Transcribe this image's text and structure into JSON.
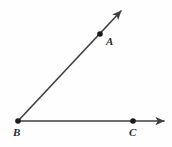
{
  "figure": {
    "name": "angle-abc-diagram",
    "type": "geometry-diagram",
    "background_color": "#fefefe",
    "stroke_color": "#3f3f3f",
    "label_color": "#2b2b2b",
    "stroke_width": 1.6,
    "dot_radius": 2.8
  },
  "points": [
    {
      "id": "A",
      "label": "A",
      "x": 100,
      "y": 34,
      "label_x": 106,
      "label_y": 36,
      "show_dot": true
    },
    {
      "id": "B",
      "label": "B",
      "x": 18,
      "y": 121,
      "label_x": 13,
      "label_y": 127,
      "show_dot": true
    },
    {
      "id": "C",
      "label": "C",
      "x": 133,
      "y": 121,
      "label_x": 129,
      "label_y": 127,
      "show_dot": true
    }
  ],
  "rays": [
    {
      "id": "ray-ba",
      "from": "B",
      "through": "A",
      "start_x": 18,
      "start_y": 121,
      "end_x": 121,
      "end_y": 11,
      "arrowhead": true
    },
    {
      "id": "ray-bc",
      "from": "B",
      "through": "C",
      "start_x": 18,
      "start_y": 121,
      "end_x": 164,
      "end_y": 121,
      "arrowhead": true
    }
  ],
  "chart_data": {
    "type": "diagram",
    "title": "",
    "vertex": "B",
    "rays": [
      "BA",
      "BC"
    ],
    "labeled_points": [
      "A",
      "B",
      "C"
    ]
  }
}
